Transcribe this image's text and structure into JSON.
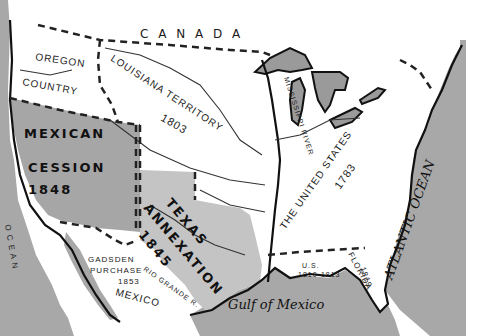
{
  "map": {
    "type": "historical territorial expansion map",
    "colors": {
      "ocean": "#a8a8a8",
      "land_white": "#ffffff",
      "mexican_cession": "#a6a6a6",
      "texas_annexation": "#c4c4c4",
      "lakes": "#9a9a9a",
      "lines": "#111111"
    },
    "labels": {
      "canada": "C A N A D A",
      "oregon_1": "OREGON",
      "oregon_2": "COUNTRY",
      "louisiana_1": "LOUISIANA TERRITORY",
      "louisiana_year": "1803",
      "mississippi": "MISSISSIPPI RIVER",
      "united_states": "THE UNITED STATES",
      "us_year": "1783",
      "mexican_1": "MEXICAN",
      "mexican_2": "CESSION",
      "mexican_year": "1848",
      "texas_1": "TEXAS",
      "texas_2": "ANNEXATION",
      "texas_year": "1845",
      "gadsden_1": "GADSDEN",
      "gadsden_2": "PURCHASE",
      "gadsden_year": "1853",
      "rio_grande": "RIO GRANDE R.",
      "mexico": "MEXICO",
      "us_west_florida_1": "U.S.",
      "us_west_florida_2": "1810-1813",
      "florida": "FLORIDA",
      "florida_year": "1819",
      "gulf": "Gulf of Mexico",
      "atlantic": "ATLANTIC OCEAN",
      "pacific": "O C E A N"
    }
  }
}
